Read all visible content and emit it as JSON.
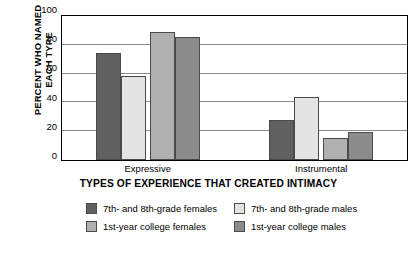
{
  "chart_data": {
    "type": "bar",
    "title": "",
    "xlabel": "TYPES OF EXPERIENCE THAT CREATED INTIMACY",
    "ylabel_lines": [
      "PERCENT WHO NAMED",
      "EACH TYPE"
    ],
    "ylabel": "PERCENT WHO NAMED EACH TYPE",
    "categories": [
      "Expressive",
      "Instrumental"
    ],
    "ylim": [
      0,
      100
    ],
    "yticks": [
      0,
      20,
      40,
      60,
      80,
      100
    ],
    "ytick_labels": [
      "0",
      "20",
      "40",
      "60",
      "80",
      "100"
    ],
    "grid": "horizontal",
    "legend_position": "bottom",
    "series": [
      {
        "name": "7th- and 8th-grade females",
        "color": "#606060",
        "values": [
          74,
          28
        ]
      },
      {
        "name": "7th- and 8th-grade males",
        "color": "#e4e4e4",
        "values": [
          58.5,
          44
        ]
      },
      {
        "name": "1st-year college females",
        "color": "#b0b0b0",
        "values": [
          89,
          15
        ]
      },
      {
        "name": "1st-year college males",
        "color": "#8c8c8c",
        "values": [
          85.5,
          19.5
        ]
      }
    ],
    "legend_order": [
      "7th- and 8th-grade females",
      "7th- and 8th-grade males",
      "1st-year college females",
      "1st-year college males"
    ]
  },
  "axis": {
    "y_title_line1": "PERCENT WHO NAMED",
    "y_title_line2": "EACH TYPE",
    "x_title": "TYPES OF EXPERIENCE THAT CREATED INTIMACY",
    "y_tick_100": "100",
    "y_tick_80": "80",
    "y_tick_60": "60",
    "y_tick_40": "40",
    "y_tick_20": "20",
    "y_tick_0": "0",
    "x_tick_1": "Expressive",
    "x_tick_2": "Instrumental"
  },
  "legend": {
    "item1": "7th- and 8th-grade females",
    "item2": "7th- and 8th-grade males",
    "item3": "1st-year college females",
    "item4": "1st-year college males"
  }
}
